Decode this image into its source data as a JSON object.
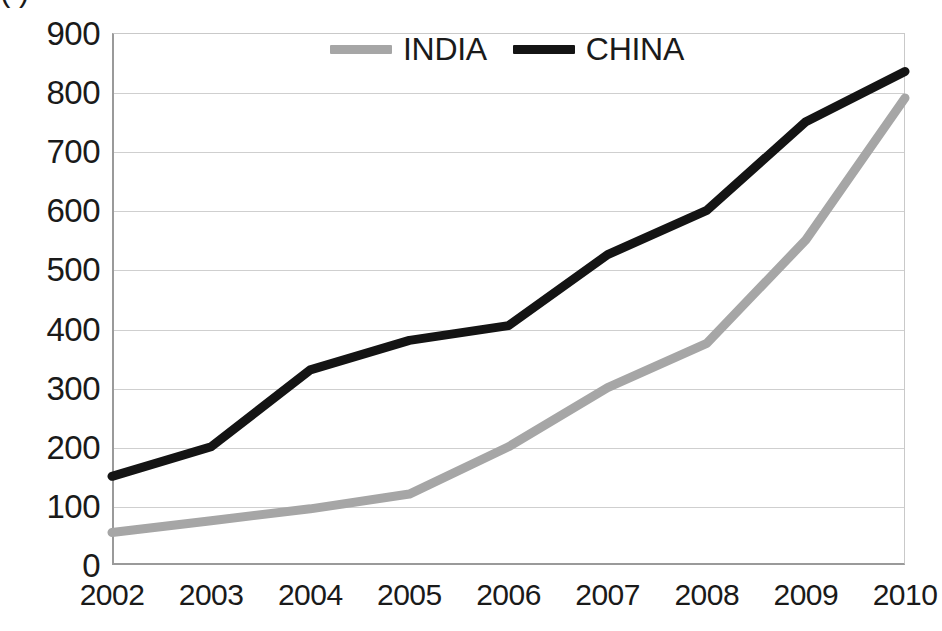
{
  "chart_title": "(                      )",
  "legend": {
    "position": "top-center-inside",
    "entries": [
      {
        "label": "INDIA",
        "color": "#a6a6a6",
        "icon": "line-swatch-icon"
      },
      {
        "label": "CHINA",
        "color": "#141414",
        "icon": "line-swatch-icon"
      }
    ]
  },
  "axes": {
    "y_ticks": [
      "900",
      "800",
      "700",
      "600",
      "500",
      "400",
      "300",
      "200",
      "100",
      "0"
    ],
    "x_ticks": [
      "2002",
      "2003",
      "2004",
      "2005",
      "2006",
      "2007",
      "2008",
      "2009",
      "2010"
    ]
  },
  "colors": {
    "india": "#a6a6a6",
    "china": "#141414",
    "grid": "#cfcfcf",
    "axis": "#9a9a9a",
    "background": "#ffffff"
  },
  "chart_data": {
    "type": "line",
    "title": "(                      )",
    "xlabel": "",
    "ylabel": "",
    "x": [
      2002,
      2003,
      2004,
      2005,
      2006,
      2007,
      2008,
      2009,
      2010
    ],
    "categories": [
      "2002",
      "2003",
      "2004",
      "2005",
      "2006",
      "2007",
      "2008",
      "2009",
      "2010"
    ],
    "xlim": [
      2002,
      2010
    ],
    "ylim": [
      0,
      900
    ],
    "y_tick_step": 100,
    "grid": true,
    "legend_position": "top-center",
    "series": [
      {
        "name": "INDIA",
        "color": "#a6a6a6",
        "values": [
          55,
          75,
          95,
          120,
          200,
          300,
          375,
          550,
          790
        ]
      },
      {
        "name": "CHINA",
        "color": "#141414",
        "values": [
          150,
          200,
          330,
          380,
          405,
          525,
          600,
          750,
          835
        ]
      }
    ]
  }
}
